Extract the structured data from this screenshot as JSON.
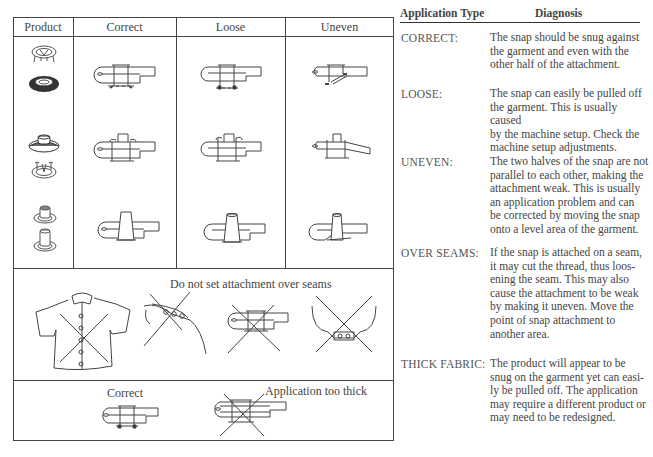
{
  "table": {
    "headers": [
      "Product",
      "Correct",
      "Loose",
      "Uneven"
    ],
    "rows": [
      {
        "product": "sport-snap",
        "correct": "attachment-correct",
        "loose": "attachment-loose",
        "uneven": "attachment-uneven"
      },
      {
        "product": "ring-snap",
        "correct": "attachment-correct",
        "loose": "attachment-loose",
        "uneven": "attachment-uneven"
      },
      {
        "product": "post-snap",
        "correct": "attachment-correct",
        "loose": "attachment-loose",
        "uneven": "attachment-uneven"
      }
    ],
    "seams_caption": "Do not set attachment over seams",
    "thick_correct_label": "Correct",
    "thick_wrong_label": "Application too thick"
  },
  "diagnosis": {
    "col_type": "Application Type",
    "col_diagnosis": "Diagnosis",
    "entries": [
      {
        "type": "CORRECT:",
        "lines": [
          "The snap should be snug against",
          "the garment and even with the",
          "other half of the attachment."
        ]
      },
      {
        "type": "LOOSE:",
        "lines": [
          "The snap can easily be pulled off",
          "the garment. This is usually caused",
          "by the machine setup. Check the",
          "machine setup adjustments."
        ]
      },
      {
        "type": "UNEVEN:",
        "lines": [
          "The two halves of the snap are not",
          "parallel to each other, making the",
          "attachment weak. This is usually",
          "an application problem and can",
          "be corrected by moving the snap",
          "onto a level area of the garment."
        ]
      },
      {
        "type": "OVER SEAMS:",
        "lines": [
          "If the snap is attached on a seam,",
          "it may cut the thread, thus loos-",
          "ening the seam. This may also",
          "cause the attachment to be weak",
          "by making it uneven. Move the",
          "point of snap attachment to",
          "another area."
        ]
      },
      {
        "type": "THICK FABRIC:",
        "lines": [
          "The product will appear to be",
          "snug on the garment yet can easi-",
          "ly be pulled off. The application",
          "may require a different product or",
          "may need to be redesigned."
        ]
      }
    ]
  }
}
